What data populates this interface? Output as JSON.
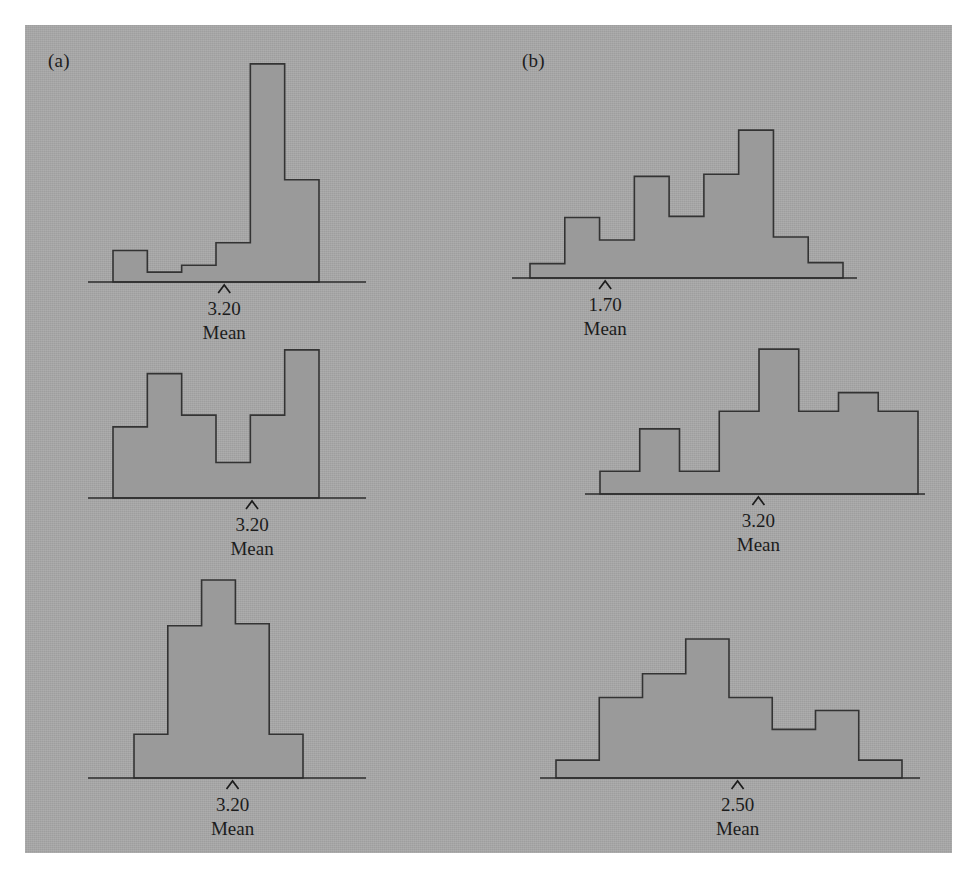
{
  "figure": {
    "background_color": "#a8a8a8",
    "bar_fill_color": "#9a9a9a",
    "bar_stroke_color": "#333333",
    "axis_color": "#2b2b2b",
    "text_color": "#1c1c1c"
  },
  "panels": [
    {
      "id": "a",
      "label": "(a)"
    },
    {
      "id": "b",
      "label": "(b)"
    }
  ],
  "captions": {
    "mean_word": "Mean"
  },
  "chart_data": [
    {
      "id": "a1",
      "type": "bar",
      "title": "",
      "panel": "(a)",
      "row": 1,
      "mean_label": "3.20",
      "mean_caption": "Mean",
      "mean_marker_position": 0.49,
      "categories": [
        "1",
        "2",
        "3",
        "4",
        "5",
        "6"
      ],
      "values": [
        32,
        10,
        17,
        40,
        222,
        104
      ],
      "ylim": [
        0,
        230
      ],
      "grid": false,
      "legend": "none"
    },
    {
      "id": "a2",
      "type": "bar",
      "title": "",
      "panel": "(a)",
      "row": 2,
      "mean_label": "3.20",
      "mean_caption": "Mean",
      "mean_marker_position": 0.59,
      "categories": [
        "1",
        "2",
        "3",
        "4",
        "5",
        "6"
      ],
      "values": [
        60,
        105,
        70,
        30,
        70,
        125
      ],
      "ylim": [
        0,
        130
      ],
      "grid": false,
      "legend": "none"
    },
    {
      "id": "a3",
      "type": "bar",
      "title": "",
      "panel": "(a)",
      "row": 3,
      "mean_label": "3.20",
      "mean_caption": "Mean",
      "mean_marker_position": 0.52,
      "categories": [
        "1",
        "2",
        "3",
        "4",
        "5"
      ],
      "values": [
        44,
        153,
        199,
        155,
        44
      ],
      "ylim": [
        0,
        205
      ],
      "grid": false,
      "legend": "none"
    },
    {
      "id": "b1",
      "type": "bar",
      "title": "",
      "panel": "(b)",
      "row": 1,
      "mean_label": "1.70",
      "mean_caption": "Mean",
      "mean_marker_position": 0.27,
      "categories": [
        "1",
        "2",
        "3",
        "4",
        "5",
        "6",
        "7",
        "8",
        "9"
      ],
      "values": [
        14,
        59,
        37,
        99,
        60,
        101,
        144,
        40,
        15
      ],
      "ylim": [
        0,
        150
      ],
      "grid": false,
      "legend": "none"
    },
    {
      "id": "b2",
      "type": "bar",
      "title": "",
      "panel": "(b)",
      "row": 2,
      "mean_label": "3.20",
      "mean_caption": "Mean",
      "mean_marker_position": 0.51,
      "categories": [
        "1",
        "2",
        "3",
        "4",
        "5",
        "6",
        "7",
        "8"
      ],
      "values": [
        22,
        63,
        22,
        80,
        140,
        80,
        98,
        80
      ],
      "ylim": [
        0,
        145
      ],
      "grid": false,
      "legend": "none"
    },
    {
      "id": "b3",
      "type": "bar",
      "title": "",
      "panel": "(b)",
      "row": 3,
      "mean_label": "2.50",
      "mean_caption": "Mean",
      "mean_marker_position": 0.52,
      "categories": [
        "1",
        "2",
        "3",
        "4",
        "5",
        "6",
        "7",
        "8"
      ],
      "values": [
        18,
        81,
        105,
        140,
        81,
        49,
        68,
        18
      ],
      "ylim": [
        0,
        145
      ],
      "grid": false,
      "legend": "none"
    }
  ],
  "layout": [
    {
      "id": "a1",
      "x": 88,
      "y": 52,
      "w": 278,
      "h": 232,
      "bar_left": 113,
      "bar_right": 319,
      "baseline": 282
    },
    {
      "id": "a2",
      "x": 88,
      "y": 340,
      "w": 278,
      "h": 162,
      "bar_left": 113,
      "bar_right": 319,
      "baseline": 498
    },
    {
      "id": "a3",
      "x": 88,
      "y": 570,
      "w": 278,
      "h": 210,
      "bar_left": 134,
      "bar_right": 303,
      "baseline": 778
    },
    {
      "id": "b1",
      "x": 512,
      "y": 120,
      "w": 345,
      "h": 160,
      "bar_left": 530,
      "bar_right": 843,
      "baseline": 278
    },
    {
      "id": "b2",
      "x": 585,
      "y": 340,
      "w": 340,
      "h": 156,
      "bar_left": 600,
      "bar_right": 918,
      "baseline": 494
    },
    {
      "id": "b3",
      "x": 540,
      "y": 630,
      "w": 380,
      "h": 150,
      "bar_left": 556,
      "bar_right": 902,
      "baseline": 778
    }
  ],
  "panel_label_positions": [
    {
      "label": "(a)",
      "x": 48,
      "y": 52
    },
    {
      "label": "(b)",
      "x": 522,
      "y": 52
    }
  ]
}
